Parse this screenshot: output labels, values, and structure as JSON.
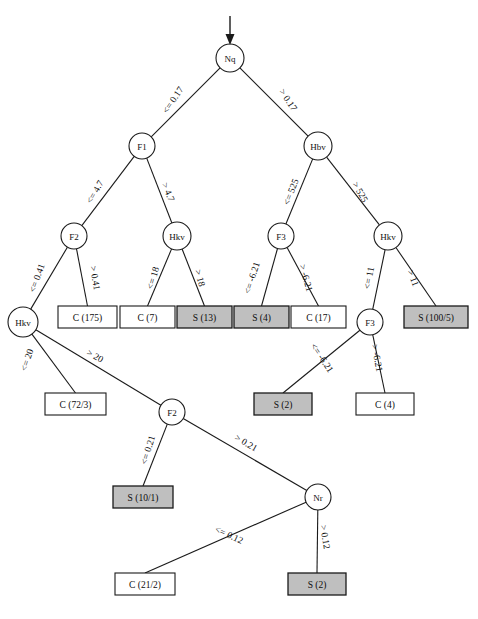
{
  "diagram": {
    "type": "decision-tree",
    "colors": {
      "leaf_class_s_fill": "#bfbfbf",
      "leaf_class_c_fill": "#ffffff",
      "stroke": "#1a1a1a"
    },
    "root_arrow": "downward-arrow-into-root"
  },
  "nodes": {
    "root": {
      "label": "Nq",
      "x": 230,
      "y": 58,
      "r": 14
    },
    "f1": {
      "label": "F1",
      "x": 142,
      "y": 146,
      "r": 13
    },
    "hbv": {
      "label": "Hbv",
      "x": 318,
      "y": 146,
      "r": 14
    },
    "f2_left": {
      "label": "F2",
      "x": 74,
      "y": 236,
      "r": 13
    },
    "hkv_mid": {
      "label": "Hkv",
      "x": 177,
      "y": 236,
      "r": 14
    },
    "f3_upper": {
      "label": "F3",
      "x": 281,
      "y": 236,
      "r": 13
    },
    "hkv_right": {
      "label": "Hkv",
      "x": 388,
      "y": 236,
      "r": 14
    },
    "hkv_left_low": {
      "label": "Hkv",
      "x": 23,
      "y": 322,
      "r": 15
    },
    "f3_lower": {
      "label": "F3",
      "x": 370,
      "y": 322,
      "r": 13
    },
    "f2_low": {
      "label": "F2",
      "x": 172,
      "y": 412,
      "r": 13
    },
    "nr": {
      "label": "Nr",
      "x": 318,
      "y": 497,
      "r": 13
    }
  },
  "leaves": [
    {
      "id": "leaf-c-175",
      "label": "C (175)",
      "cls": "C",
      "x": 58,
      "y": 306,
      "w": 59,
      "h": 22
    },
    {
      "id": "leaf-c-7",
      "label": "C (7)",
      "cls": "C",
      "x": 120,
      "y": 306,
      "w": 55,
      "h": 22
    },
    {
      "id": "leaf-s-13",
      "label": "S (13)",
      "cls": "S",
      "x": 177,
      "y": 306,
      "w": 55,
      "h": 22
    },
    {
      "id": "leaf-s-4",
      "label": "S (4)",
      "cls": "S",
      "x": 234,
      "y": 306,
      "w": 55,
      "h": 22
    },
    {
      "id": "leaf-c-17",
      "label": "C (17)",
      "cls": "C",
      "x": 291,
      "y": 306,
      "w": 55,
      "h": 22
    },
    {
      "id": "leaf-s-100-5",
      "label": "S (100/5)",
      "cls": "S",
      "x": 404,
      "y": 306,
      "w": 64,
      "h": 22
    },
    {
      "id": "leaf-c-72-3",
      "label": "C (72/3)",
      "cls": "C",
      "x": 45,
      "y": 393,
      "w": 61,
      "h": 22
    },
    {
      "id": "leaf-s-2-upper",
      "label": "S (2)",
      "cls": "S",
      "x": 254,
      "y": 393,
      "w": 58,
      "h": 22
    },
    {
      "id": "leaf-c-4",
      "label": "C (4)",
      "cls": "C",
      "x": 356,
      "y": 393,
      "w": 58,
      "h": 22
    },
    {
      "id": "leaf-s-10-1",
      "label": "S (10/1)",
      "cls": "S",
      "x": 113,
      "y": 486,
      "w": 60,
      "h": 22
    },
    {
      "id": "leaf-c-21-2",
      "label": "C (21/2)",
      "cls": "C",
      "x": 115,
      "y": 573,
      "w": 60,
      "h": 22
    },
    {
      "id": "leaf-s-2-lower",
      "label": "S (2)",
      "cls": "S",
      "x": 288,
      "y": 573,
      "w": 58,
      "h": 22
    }
  ],
  "edges": [
    {
      "id": "edge-root-left",
      "label": "<= 0.17",
      "from": "root",
      "to": "f1",
      "lx": 173,
      "ly": 100,
      "angle": -56
    },
    {
      "id": "edge-root-right",
      "label": "> 0.17",
      "from": "root",
      "to": "hbv",
      "lx": 288,
      "ly": 100,
      "angle": 56
    },
    {
      "id": "edge-f1-left",
      "label": "<= 4.7",
      "from": "f1",
      "to": "f2_left",
      "lx": 95,
      "ly": 192,
      "angle": -60
    },
    {
      "id": "edge-f1-right",
      "label": "> 4.7",
      "from": "f1",
      "to": "hkv_mid",
      "lx": 168,
      "ly": 192,
      "angle": 67
    },
    {
      "id": "edge-hbv-left",
      "label": "<= 525",
      "from": "hbv",
      "to": "f3_upper",
      "lx": 291,
      "ly": 192,
      "angle": -68
    },
    {
      "id": "edge-hbv-right",
      "label": "> 525",
      "from": "hbv",
      "to": "hkv_right",
      "lx": 360,
      "ly": 192,
      "angle": 60
    },
    {
      "id": "edge-f2left-left",
      "label": "<= 0.41",
      "from": "f2_left",
      "to": "hkv_left_low",
      "lx": 37,
      "ly": 278,
      "angle": -70
    },
    {
      "id": "edge-f2left-right",
      "label": "> 0.41",
      "from": "f2_left",
      "to": "leaf-c-175",
      "lx": 95,
      "ly": 278,
      "angle": 80
    },
    {
      "id": "edge-hkvmid-left",
      "label": "<= 18",
      "from": "hkv_mid",
      "to": "leaf-c-7",
      "lx": 153,
      "ly": 278,
      "angle": -73
    },
    {
      "id": "edge-hkvmid-right",
      "label": "> 18",
      "from": "hkv_mid",
      "to": "leaf-s-13",
      "lx": 200,
      "ly": 278,
      "angle": 75
    },
    {
      "id": "edge-f3up-left",
      "label": "<= -6.21",
      "from": "f3_upper",
      "to": "leaf-s-4",
      "lx": 252,
      "ly": 278,
      "angle": -72
    },
    {
      "id": "edge-f3up-right",
      "label": "> -6.21",
      "from": "f3_upper",
      "to": "leaf-c-17",
      "lx": 306,
      "ly": 278,
      "angle": 74
    },
    {
      "id": "edge-hkvright-left",
      "label": "<= 11",
      "from": "hkv_right",
      "to": "f3_lower",
      "lx": 369,
      "ly": 278,
      "angle": -79
    },
    {
      "id": "edge-hkvright-right",
      "label": "> 11",
      "from": "hkv_right",
      "to": "leaf-s-100-5",
      "lx": 413,
      "ly": 278,
      "angle": 69
    },
    {
      "id": "edge-hkvlow-left",
      "label": "<= 20",
      "from": "hkv_left_low",
      "to": "leaf-c-72-3",
      "lx": 27,
      "ly": 360,
      "angle": -71
    },
    {
      "id": "edge-hkvlow-right",
      "label": "> 20",
      "from": "hkv_left_low",
      "to": "f2_low",
      "lx": 95,
      "ly": 356,
      "angle": 29
    },
    {
      "id": "edge-f3low-left",
      "label": "<= -6.21",
      "from": "f3_lower",
      "to": "leaf-s-2-upper",
      "lx": 322,
      "ly": 358,
      "angle": 56
    },
    {
      "id": "edge-f3low-right",
      "label": "> -6.21",
      "from": "f3_lower",
      "to": "leaf-c-4",
      "lx": 377,
      "ly": 358,
      "angle": 79
    },
    {
      "id": "edge-f2low-left",
      "label": "<= 0.21",
      "from": "f2_low",
      "to": "leaf-s-10-1",
      "lx": 148,
      "ly": 450,
      "angle": -73
    },
    {
      "id": "edge-f2low-right",
      "label": "> 0.21",
      "from": "f2_low",
      "to": "nr",
      "lx": 246,
      "ly": 443,
      "angle": 30
    },
    {
      "id": "edge-nr-left",
      "label": "<= 0.12",
      "from": "nr",
      "to": "leaf-c-21-2",
      "lx": 229,
      "ly": 535,
      "angle": 25
    },
    {
      "id": "edge-nr-right",
      "label": "> 0.12",
      "from": "nr",
      "to": "leaf-s-2-lower",
      "lx": 325,
      "ly": 537,
      "angle": 81
    }
  ]
}
